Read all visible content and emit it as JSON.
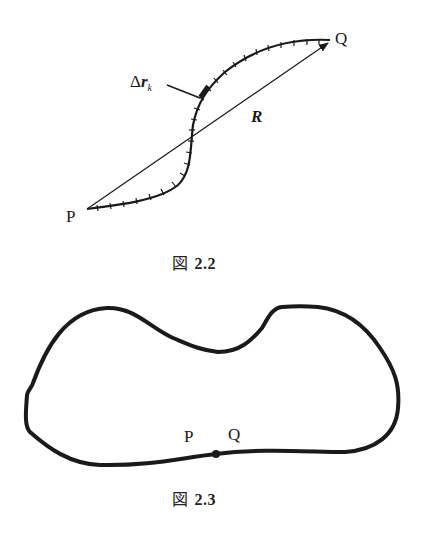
{
  "figures": [
    {
      "id": "fig-2-2",
      "caption": {
        "prefix": "図",
        "number": "2.2"
      },
      "labels": {
        "start_point": "P",
        "end_point": "Q",
        "vector": "R",
        "segment_delta": "Δ",
        "segment_r": "r",
        "segment_sub": "k"
      },
      "description": "S-shaped path from P to Q divided into small segments Δr_k, with straight displacement vector R from P to Q"
    },
    {
      "id": "fig-2-3",
      "caption": {
        "prefix": "図",
        "number": "2.3"
      },
      "labels": {
        "start_point": "P",
        "end_point": "Q"
      },
      "description": "Closed loop path where start point P and end point Q coincide"
    }
  ],
  "colors": {
    "ink": "#1a1a1a",
    "background": "#ffffff"
  }
}
